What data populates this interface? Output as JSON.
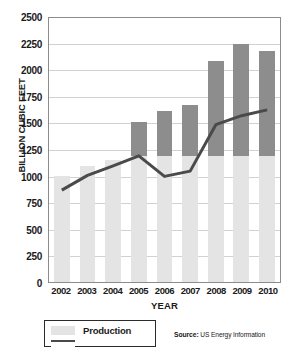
{
  "chart_data": {
    "type": "bar",
    "title": "",
    "xlabel": "YEAR",
    "ylabel": "BILLION CUBIC FEET",
    "ylim": [
      0,
      2500
    ],
    "ytick_step": 250,
    "yticks": [
      2500,
      2250,
      2000,
      1750,
      1500,
      1250,
      1000,
      750,
      500,
      250,
      0
    ],
    "categories": [
      "2002",
      "2003",
      "2004",
      "2005",
      "2006",
      "2007",
      "2008",
      "2009",
      "2010"
    ],
    "grid": true,
    "legend_position": "bottom-left",
    "series": [
      {
        "name": "Production",
        "render": "bar",
        "color": "#e4e4e4",
        "values": [
          1000,
          1090,
          1145,
          1185,
          1185,
          1185,
          1185,
          1185,
          1185
        ]
      },
      {
        "name": "Imports",
        "render": "bar",
        "color": "#8d8d8d",
        "stacked_on": "Production",
        "values": [
          0,
          0,
          0,
          315,
          425,
          475,
          895,
          1050,
          985
        ]
      },
      {
        "name": "Production",
        "render": "line",
        "color": "#4a4a4a",
        "values": [
          870,
          1010,
          1100,
          1195,
          1000,
          1050,
          1490,
          1575,
          1630
        ]
      }
    ],
    "bar_totals": [
      1000,
      1090,
      1145,
      1500,
      1610,
      1660,
      2080,
      2235,
      2170
    ]
  },
  "axis": {
    "y_title": "BILLION CUBIC FEET",
    "x_title": "YEAR"
  },
  "legend": {
    "items": [
      {
        "label": "Production",
        "swatch": "bar-light"
      },
      {
        "label": "",
        "swatch": "line-dark"
      }
    ]
  },
  "source": {
    "label": "Source:",
    "text": "US Energy Information"
  },
  "colors": {
    "bar_light": "#e4e4e4",
    "bar_dark": "#8d8d8d",
    "line": "#4a4a4a",
    "grid": "#d2d2d2",
    "axis": "#8c8c8c"
  }
}
